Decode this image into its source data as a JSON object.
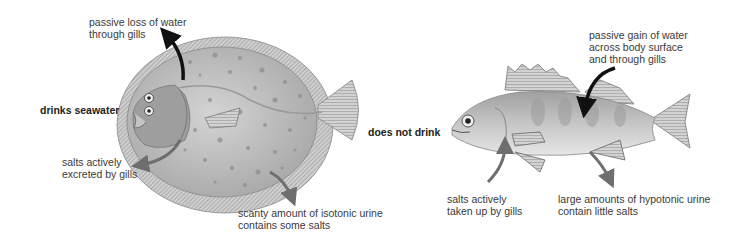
{
  "left_fish": {
    "type": "saltwater fish (flounder)",
    "behavior_label": "drinks seawater",
    "labels": {
      "water_loss": [
        "passive loss of water",
        "through gills"
      ],
      "salt_excretion": [
        "salts actively",
        "excreted by gills"
      ],
      "urine": [
        "scanty amount of isotonic urine",
        "contains some salts"
      ]
    }
  },
  "right_fish": {
    "type": "freshwater fish (perch)",
    "behavior_label": "does not drink",
    "labels": {
      "water_gain": [
        "passive gain of water",
        "across body surface",
        "and through gills"
      ],
      "salt_uptake": [
        "salts actively",
        "taken up by gills"
      ],
      "urine": [
        "large amounts of hypotonic urine",
        "contain little salts"
      ]
    }
  },
  "colors": {
    "water_arrow": "#111111",
    "salt_arrow": "#6e6e6e",
    "body": "#b8b8b8",
    "text": "#3a3a3a"
  }
}
